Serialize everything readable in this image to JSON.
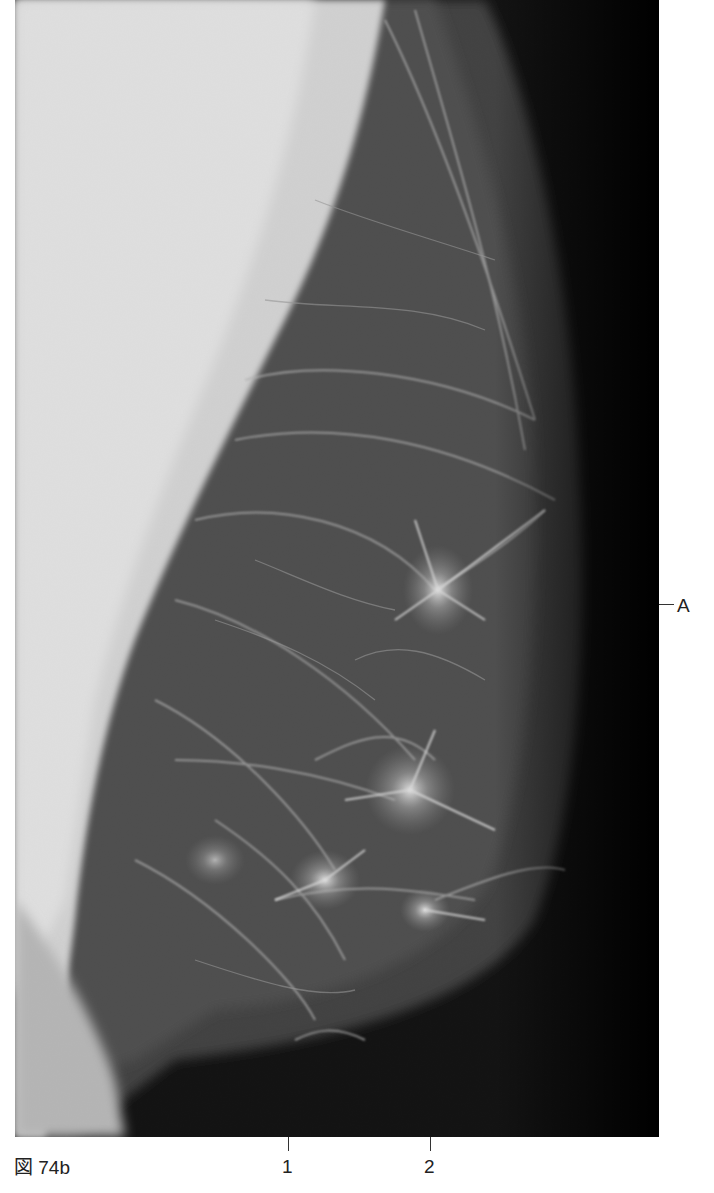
{
  "figure": {
    "caption": "図 74b"
  },
  "annotations": {
    "bottom": [
      {
        "label": "1",
        "x": 288
      },
      {
        "label": "2",
        "x": 430
      }
    ],
    "right": [
      {
        "label": "A",
        "y": 605
      }
    ]
  },
  "colors": {
    "background": "#ffffff",
    "film_dark": "#050505",
    "pectoral_light": "#e2e2e2",
    "label_text": "#222222"
  }
}
